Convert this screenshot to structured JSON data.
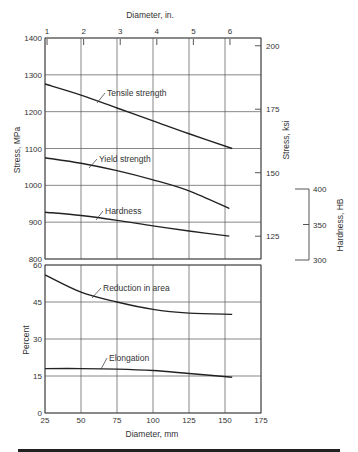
{
  "chart_data": [
    {
      "type": "line",
      "panel": "upper",
      "title": "",
      "xlabel": "Diameter, mm",
      "x2label": "Diameter, in.",
      "ylabel": "Stress, MPa",
      "y2label": "Stress, ksi",
      "y3label": "Hardness, HB",
      "xlim": [
        25,
        175
      ],
      "ylim": [
        800,
        1400
      ],
      "grid": true,
      "x_ticks": [
        25,
        50,
        75,
        100,
        125,
        150,
        175
      ],
      "x2_ticks": [
        1,
        2,
        3,
        4,
        5,
        6
      ],
      "y_ticks": [
        800,
        900,
        1000,
        1100,
        1200,
        1300,
        1400
      ],
      "y2_ticks": [
        125,
        150,
        175,
        200
      ],
      "y3_ticks": [
        300,
        350,
        400
      ],
      "series": [
        {
          "name": "Tensile strength",
          "x": [
            25,
            50,
            75,
            100,
            125,
            155
          ],
          "values": [
            1275,
            1245,
            1210,
            1175,
            1140,
            1100
          ]
        },
        {
          "name": "Yield strength",
          "x": [
            25,
            50,
            75,
            100,
            125,
            153
          ],
          "values": [
            1075,
            1060,
            1040,
            1015,
            985,
            937
          ]
        },
        {
          "name": "Hardness",
          "x": [
            25,
            50,
            75,
            100,
            125,
            153
          ],
          "values": [
            927,
            918,
            905,
            890,
            876,
            862
          ]
        }
      ]
    },
    {
      "type": "line",
      "panel": "lower",
      "title": "",
      "xlabel": "Diameter, mm",
      "ylabel": "Percent",
      "xlim": [
        25,
        175
      ],
      "ylim": [
        0,
        60
      ],
      "grid": true,
      "x_ticks": [
        25,
        50,
        75,
        100,
        125,
        150,
        175
      ],
      "y_ticks": [
        0,
        15,
        30,
        45,
        60
      ],
      "series": [
        {
          "name": "Reduction in area",
          "x": [
            25,
            50,
            75,
            100,
            125,
            155
          ],
          "values": [
            56,
            49,
            45,
            42,
            40.5,
            40
          ]
        },
        {
          "name": "Elongation",
          "x": [
            25,
            50,
            75,
            100,
            125,
            155
          ],
          "values": [
            18,
            18,
            17.8,
            17.2,
            16,
            14.5
          ]
        }
      ]
    }
  ],
  "labels": {
    "x_top": "Diameter, in.",
    "x_bottom": "Diameter, mm",
    "y_upper_left": "Stress, MPa",
    "y_upper_right": "Stress, ksi",
    "y_hardness": "Hardness, HB",
    "y_lower_left": "Percent"
  }
}
